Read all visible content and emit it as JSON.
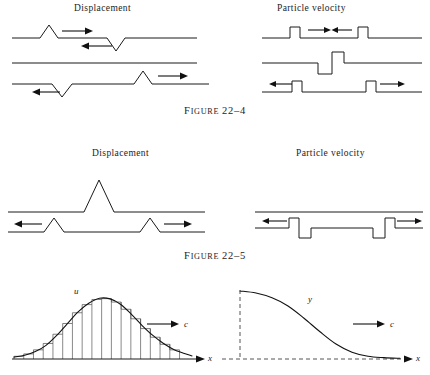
{
  "page": {
    "background_color": "#ffffff",
    "ink_color": "#1a1a1a"
  },
  "figures": [
    {
      "id": "figure-22-4",
      "caption_prefix": "F",
      "caption_word": "IGURE",
      "caption_number": "22–4",
      "caption_full": "Figure 22–4",
      "columns": [
        {
          "id": "displacement",
          "title": "Displacement"
        },
        {
          "id": "particle-velocity",
          "title": "Particle velocity"
        }
      ]
    },
    {
      "id": "figure-22-5",
      "caption_prefix": "F",
      "caption_word": "IGURE",
      "caption_number": "22–5",
      "caption_full": "Figure 22–5",
      "columns": [
        {
          "id": "displacement",
          "title": "Displacement"
        },
        {
          "id": "particle-velocity",
          "title": "Particle velocity"
        }
      ]
    }
  ],
  "chart_data": [
    {
      "id": "displacement-22-4-top",
      "type": "line",
      "title": "Displacement",
      "description": "Two opposite triangular pulses approaching each other on a baseline",
      "xlabel": "",
      "ylabel": "",
      "baseline": 0,
      "series": [
        {
          "name": "displacement",
          "x": [
            0,
            28,
            37,
            46,
            95,
            104,
            113,
            170
          ],
          "values": [
            0,
            0,
            1,
            0,
            0,
            -1,
            0,
            0
          ]
        }
      ],
      "annotations": [
        {
          "label": "right-arrow",
          "direction": "right",
          "x": 52,
          "y": 0.72
        },
        {
          "label": "left-arrow",
          "direction": "left",
          "x": 88,
          "y": -0.45
        }
      ]
    },
    {
      "id": "displacement-22-4-middle",
      "type": "line",
      "title": "",
      "description": "Flat baseline: pulses cancel at the instant of overlap",
      "baseline": 0,
      "series": [
        {
          "name": "displacement",
          "x": [
            0,
            170
          ],
          "values": [
            0,
            0
          ]
        }
      ],
      "annotations": []
    },
    {
      "id": "displacement-22-4-bottom",
      "type": "line",
      "title": "",
      "description": "Pulses have passed through each other and separated",
      "baseline": 0,
      "series": [
        {
          "name": "displacement",
          "x": [
            0,
            40,
            50,
            60,
            122,
            131,
            140,
            190
          ],
          "values": [
            0,
            0,
            -1,
            0,
            0,
            1,
            0,
            0
          ]
        }
      ],
      "annotations": [
        {
          "label": "left-arrow",
          "direction": "left",
          "x": 22,
          "y": -0.55
        },
        {
          "label": "right-arrow",
          "direction": "right",
          "x": 152,
          "y": 0.7
        }
      ]
    },
    {
      "id": "particle-velocity-22-4-top",
      "type": "line",
      "title": "Particle velocity",
      "description": "Two square pulses of opposite travel direction approaching",
      "baseline": 0,
      "series": [
        {
          "name": "velocity",
          "x": [
            0,
            28,
            28,
            38,
            38,
            96,
            96,
            106,
            106,
            150
          ],
          "values": [
            0,
            0,
            1,
            1,
            0,
            0,
            1,
            1,
            0,
            0
          ]
        }
      ],
      "annotations": [
        {
          "label": "right-arrow",
          "direction": "right",
          "x": 50,
          "y": 0.8
        },
        {
          "label": "left-arrow",
          "direction": "left",
          "x": 82,
          "y": 0.8
        }
      ]
    },
    {
      "id": "particle-velocity-22-4-middle",
      "type": "line",
      "title": "",
      "description": "At overlap the particle velocities add to a down-up step pair",
      "baseline": 0,
      "series": [
        {
          "name": "velocity",
          "x": [
            0,
            56,
            56,
            70,
            70,
            82,
            82,
            150
          ],
          "values": [
            0,
            0,
            -1,
            -1,
            1,
            1,
            0,
            0
          ]
        }
      ],
      "annotations": []
    },
    {
      "id": "particle-velocity-22-4-bottom",
      "type": "line",
      "title": "",
      "description": "Square pulses separated after passing through each other",
      "baseline": 0,
      "series": [
        {
          "name": "velocity",
          "x": [
            0,
            30,
            30,
            40,
            40,
            104,
            104,
            114,
            114,
            160
          ],
          "values": [
            0,
            0,
            1,
            1,
            0,
            0,
            1,
            1,
            0,
            0
          ]
        }
      ],
      "annotations": [
        {
          "label": "left-arrow",
          "direction": "left",
          "x": 16,
          "y": 0.82
        },
        {
          "label": "right-arrow",
          "direction": "right",
          "x": 128,
          "y": 0.82
        }
      ]
    },
    {
      "id": "displacement-22-5-top",
      "type": "line",
      "title": "Displacement",
      "description": "Single large triangular pulse at maximum constructive overlap",
      "baseline": 0,
      "series": [
        {
          "name": "displacement",
          "x": [
            0,
            72,
            88,
            104,
            190
          ],
          "values": [
            0,
            0,
            1,
            0,
            0
          ]
        }
      ],
      "annotations": []
    },
    {
      "id": "displacement-22-5-bottom",
      "type": "line",
      "title": "",
      "description": "Two small triangular pulses separating in opposite directions",
      "baseline": 0,
      "series": [
        {
          "name": "displacement",
          "x": [
            0,
            33,
            43,
            53,
            124,
            134,
            144,
            190
          ],
          "values": [
            0,
            0,
            0.5,
            0,
            0,
            0.5,
            0,
            0
          ]
        }
      ],
      "annotations": [
        {
          "label": "left-arrow",
          "direction": "left",
          "x": 14,
          "y": 0.4
        },
        {
          "label": "right-arrow",
          "direction": "right",
          "x": 155,
          "y": 0.4
        }
      ]
    },
    {
      "id": "particle-velocity-22-5-top",
      "type": "line",
      "title": "Particle velocity",
      "description": "Flat line: net particle velocity zero at maximum displacement",
      "baseline": 0,
      "series": [
        {
          "name": "velocity",
          "x": [
            0,
            165
          ],
          "values": [
            0,
            0
          ]
        }
      ],
      "annotations": []
    },
    {
      "id": "particle-velocity-22-5-bottom",
      "type": "line",
      "title": "",
      "description": "Two up-down square pulse pairs travelling apart",
      "baseline": 0,
      "series": [
        {
          "name": "velocity",
          "x": [
            0,
            34,
            34,
            44,
            44,
            56,
            56,
            118,
            118,
            130,
            130,
            140,
            140,
            165
          ],
          "values": [
            0,
            0,
            1,
            1,
            -1,
            -1,
            0,
            0,
            -1,
            -1,
            1,
            1,
            0,
            0
          ]
        }
      ],
      "annotations": [
        {
          "label": "left-arrow",
          "direction": "left",
          "x": 14,
          "y": 0.85
        },
        {
          "label": "right-arrow",
          "direction": "right",
          "x": 150,
          "y": 0.85
        }
      ]
    },
    {
      "id": "chart-u-x",
      "type": "line",
      "title": "",
      "curve_label": "u",
      "xlabel": "x",
      "ylabel": "u",
      "velocity_label": "c",
      "description": "Bell-shaped pulse u(x) approximated by a staircase of rectangular strips, travelling right with speed c",
      "axis_style": "solid-with-arrow",
      "strip_count": 17,
      "x": [
        0,
        0.06,
        0.12,
        0.18,
        0.24,
        0.3,
        0.36,
        0.42,
        0.48,
        0.54,
        0.6,
        0.66,
        0.72,
        0.78,
        0.84,
        0.9,
        1.0
      ],
      "values": [
        0.03,
        0.06,
        0.12,
        0.22,
        0.38,
        0.57,
        0.76,
        0.9,
        0.98,
        0.97,
        0.88,
        0.72,
        0.54,
        0.38,
        0.25,
        0.15,
        0.05
      ],
      "ylim": [
        0,
        1
      ],
      "grid": false
    },
    {
      "id": "chart-y-x",
      "type": "line",
      "title": "",
      "curve_label": "y",
      "xlabel": "x",
      "ylabel": "y",
      "velocity_label": "c",
      "description": "Smooth sigmoid profile y(x) decaying to zero, travelling right with speed c; axes drawn dashed",
      "axis_style": "dashed",
      "x": [
        0,
        0.1,
        0.2,
        0.3,
        0.4,
        0.5,
        0.6,
        0.7,
        0.8,
        0.9,
        1.0
      ],
      "values": [
        1.0,
        0.97,
        0.9,
        0.78,
        0.6,
        0.4,
        0.22,
        0.1,
        0.04,
        0.02,
        0.01
      ],
      "ylim": [
        0,
        1
      ],
      "grid": false
    }
  ],
  "labels": {
    "u": "u",
    "y": "y",
    "x_axis": "x",
    "speed_c": "c"
  }
}
